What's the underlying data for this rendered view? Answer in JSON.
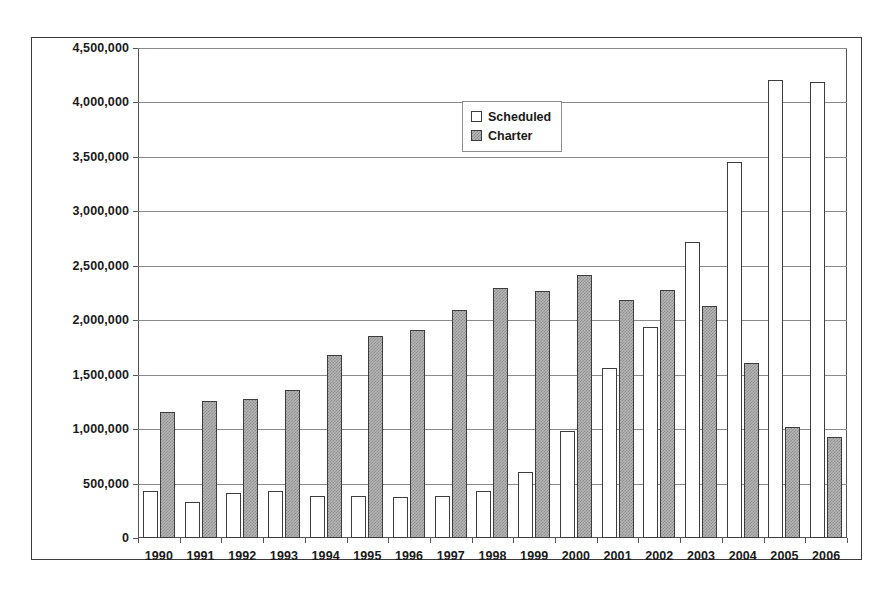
{
  "chart_data": {
    "type": "bar",
    "title": "",
    "subtitle": "",
    "xlabel": "",
    "ylabel": "",
    "categories": [
      "1990",
      "1991",
      "1992",
      "1993",
      "1994",
      "1995",
      "1996",
      "1997",
      "1998",
      "1999",
      "2000",
      "2001",
      "2002",
      "2003",
      "2004",
      "2005",
      "2006"
    ],
    "series": [
      {
        "name": "Scheduled",
        "color": "#ffffff",
        "values": [
          430000,
          335000,
          415000,
          430000,
          390000,
          390000,
          380000,
          385000,
          430000,
          610000,
          985000,
          1565000,
          1935000,
          2715000,
          3450000,
          4210000,
          4190000
        ]
      },
      {
        "name": "Charter",
        "color": "#b5b5b5",
        "values": [
          1160000,
          1255000,
          1275000,
          1360000,
          1680000,
          1855000,
          1910000,
          2095000,
          2295000,
          2270000,
          2415000,
          2185000,
          2280000,
          2135000,
          1610000,
          1020000,
          925000
        ]
      }
    ],
    "ylim": [
      0,
      4500000
    ],
    "ytick_values": [
      0,
      500000,
      1000000,
      1500000,
      2000000,
      2500000,
      3000000,
      3500000,
      4000000,
      4500000
    ],
    "ytick_labels": [
      "0",
      "500,000",
      "1,000,000",
      "1,500,000",
      "2,000,000",
      "2,500,000",
      "3,000,000",
      "3,500,000",
      "4,000,000",
      "4,500,000"
    ],
    "grid": true,
    "grid_axis": "y",
    "legend_position": "top-center",
    "legend_entries": [
      "Scheduled",
      "Charter"
    ]
  }
}
